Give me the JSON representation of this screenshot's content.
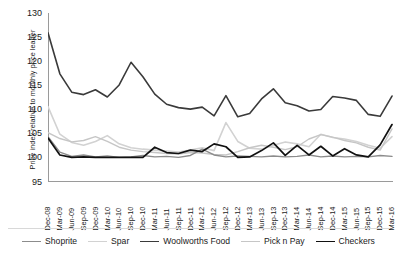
{
  "chart_data": {
    "type": "line",
    "title": "",
    "xlabel": "",
    "ylabel": "Price index relative to monthly price leader",
    "ylim": [
      95,
      130
    ],
    "yticks": [
      130,
      125,
      120,
      115,
      110,
      105,
      100,
      95
    ],
    "grid": false,
    "legend_position": "bottom",
    "categories": [
      "Dec-08",
      "Mar-09",
      "Jun-09",
      "Sep-09",
      "Dec-09",
      "Mar-10",
      "Jun-10",
      "Sep-10",
      "Dec-10",
      "Mar-11",
      "Jun-11",
      "Sep-11",
      "Dec-11",
      "Mar-12",
      "Jun-12",
      "Sep-12",
      "Dec-12",
      "Mar-13",
      "Jun-13",
      "Sep-13",
      "Dec-13",
      "Mar-14",
      "Jun-14",
      "Sep-14",
      "Dec-14",
      "Mar-15",
      "Jun-15",
      "Sep-15",
      "Dec-15",
      "Mar-16"
    ],
    "series": [
      {
        "name": "Shoprite",
        "color": "#8c8c8c",
        "width": 1.4,
        "values": [
          104.4,
          101.2,
          100.3,
          100.6,
          100.2,
          100.4,
          100.1,
          100.2,
          100.5,
          100.2,
          100.3,
          100.1,
          100.5,
          101.8,
          100.6,
          100.2,
          100.4,
          100.3,
          100.2,
          100.4,
          100.2,
          100.3,
          100.6,
          100.2,
          100.4,
          100.2,
          100.3,
          100.2,
          100.5,
          100.3
        ]
      },
      {
        "name": "Spar",
        "color": "#d2d2d2",
        "width": 1.6,
        "values": [
          110.6,
          104.9,
          103.2,
          102.6,
          103.4,
          104.6,
          102.9,
          102.1,
          101.8,
          101.6,
          101.4,
          101.2,
          101.6,
          102.1,
          101.5,
          107.3,
          103.4,
          102.0,
          101.8,
          102.6,
          103.3,
          102.9,
          102.3,
          104.9,
          104.2,
          103.9,
          103.4,
          102.6,
          102.0,
          104.4
        ]
      },
      {
        "name": "Woolworths Food",
        "color": "#3a3a3a",
        "width": 1.6,
        "values": [
          125.9,
          117.4,
          113.6,
          113.1,
          114.1,
          112.6,
          115.1,
          119.8,
          116.8,
          113.2,
          111.1,
          110.4,
          110.1,
          110.5,
          108.7,
          112.9,
          108.5,
          109.2,
          112.2,
          114.3,
          111.4,
          110.8,
          109.7,
          110.0,
          112.7,
          112.4,
          111.9,
          109.0,
          108.6,
          112.8
        ]
      },
      {
        "name": "Pick n Pay",
        "color": "#c6c6c6",
        "width": 1.4,
        "values": [
          105.2,
          104.0,
          103.3,
          103.6,
          104.4,
          103.4,
          102.2,
          101.6,
          101.3,
          101.1,
          100.9,
          100.8,
          101.1,
          101.0,
          100.7,
          100.6,
          101.3,
          102.1,
          102.6,
          102.2,
          101.7,
          102.3,
          103.9,
          104.8,
          104.3,
          103.6,
          103.1,
          102.2,
          101.6,
          106.0
        ]
      },
      {
        "name": "Checkers",
        "color": "#111111",
        "width": 1.7,
        "values": [
          104.1,
          100.6,
          100.1,
          100.2,
          100.1,
          100.1,
          100.1,
          100.1,
          100.1,
          102.2,
          101.1,
          100.9,
          101.6,
          101.3,
          102.9,
          102.3,
          100.1,
          100.2,
          101.5,
          103.1,
          100.5,
          102.6,
          100.6,
          102.4,
          100.4,
          101.9,
          100.6,
          100.2,
          102.7,
          106.9
        ]
      }
    ]
  },
  "legend": {
    "items": [
      {
        "label": "Shoprite"
      },
      {
        "label": "Spar"
      },
      {
        "label": "Woolworths Food"
      },
      {
        "label": "Pick n Pay"
      },
      {
        "label": "Checkers"
      }
    ]
  }
}
